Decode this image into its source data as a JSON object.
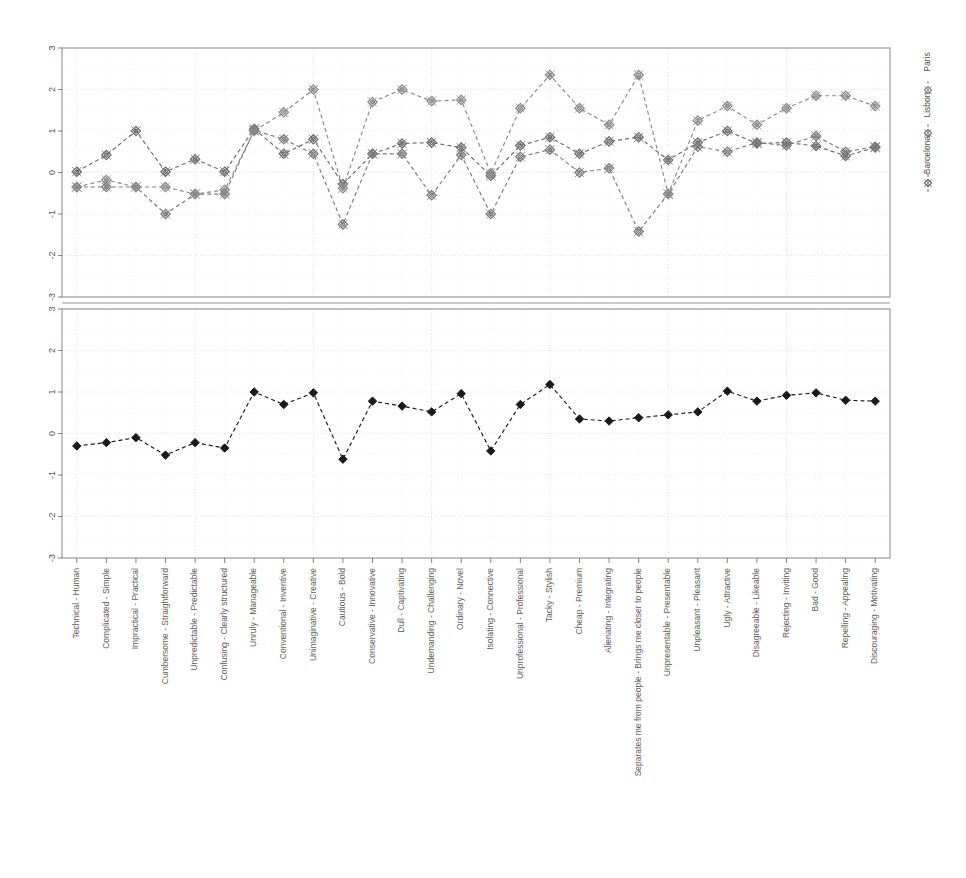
{
  "chart_data": {
    "type": "line",
    "title": "",
    "xlabel": "",
    "ylabel": "",
    "ylim": [
      -3,
      3
    ],
    "yticks": [
      3,
      2,
      1,
      0,
      -1,
      -2,
      -3
    ],
    "grid": true,
    "legend": {
      "position": "right",
      "orientation": "vertical-rotated",
      "entries": [
        "Barcelona",
        "Lisbon",
        "Paris"
      ]
    },
    "panels": [
      {
        "name": "top-panel",
        "series_names": [
          "Barcelona",
          "Lisbon",
          "Paris"
        ]
      },
      {
        "name": "bottom-panel",
        "series_names": [
          "Overall"
        ]
      }
    ],
    "categories": [
      "Technical - Human",
      "Complicated - Simple",
      "Impractical - Practical",
      "Cumbersome - Straightforward",
      "Unpredictable - Predictable",
      "Confusing - Clearly structured",
      "Unruly - Manageable",
      "Conventional - Inventive",
      "Unimaginative - Creative",
      "Cautious - Bold",
      "Conservative - Innovative",
      "Dull - Captivating",
      "Undemanding - Challenging",
      "Ordinary - Novel",
      "Isolating - Connective",
      "Unprofessional - Professional",
      "Tacky - Stylish",
      "Cheap - Premium",
      "Alienating - Integrating",
      "Separates me from people - Brings me closer to people",
      "Unpresentable - Presentable",
      "Unpleasant - Pleasant",
      "Ugly - Attractive",
      "Disagreeable - Likeable",
      "Rejecting - Inviting",
      "Bad - Good",
      "Repelling - Appealing",
      "Discouraging - Motivating"
    ],
    "series": [
      {
        "name": "Barcelona",
        "panel": "top-panel",
        "color": "#6d6d6d",
        "marker": "diamond",
        "values": [
          0.02,
          0.42,
          1.0,
          0.02,
          0.32,
          0.02,
          1.05,
          0.45,
          0.8,
          -0.28,
          0.45,
          0.7,
          0.72,
          0.6,
          -0.08,
          0.65,
          0.85,
          0.45,
          0.75,
          0.85,
          0.3,
          0.72,
          1.0,
          0.7,
          0.72,
          0.64,
          0.4,
          0.6
        ]
      },
      {
        "name": "Lisbon",
        "panel": "top-panel",
        "color": "#7a7a7a",
        "marker": "diamond",
        "values": [
          -0.35,
          -0.35,
          -0.35,
          -1.0,
          -0.52,
          -0.52,
          1.02,
          0.8,
          0.45,
          -1.25,
          0.45,
          0.45,
          -0.55,
          0.42,
          -1.0,
          0.38,
          0.55,
          0.0,
          0.1,
          -1.42,
          -0.52,
          0.62,
          0.5,
          0.72,
          0.65,
          0.88,
          0.5,
          0.62
        ]
      },
      {
        "name": "Paris",
        "panel": "top-panel",
        "color": "#8a8a8a",
        "marker": "diamond",
        "values": [
          -0.35,
          -0.18,
          -0.35,
          -0.35,
          -0.52,
          -0.42,
          1.0,
          1.45,
          2.0,
          -0.38,
          1.7,
          2.0,
          1.72,
          1.75,
          -0.02,
          1.55,
          2.35,
          1.55,
          1.15,
          2.35,
          -0.52,
          1.25,
          1.6,
          1.15,
          1.55,
          1.85,
          1.85,
          1.6
        ]
      },
      {
        "name": "Overall",
        "panel": "bottom-panel",
        "color": "#1a1a1a",
        "marker": "diamond-filled",
        "values": [
          -0.3,
          -0.22,
          -0.1,
          -0.52,
          -0.22,
          -0.35,
          1.0,
          0.7,
          0.98,
          -0.62,
          0.78,
          0.66,
          0.52,
          0.96,
          -0.42,
          0.7,
          1.18,
          0.35,
          0.3,
          0.38,
          0.45,
          0.52,
          1.02,
          0.78,
          0.92,
          0.98,
          0.8,
          0.78
        ]
      }
    ]
  },
  "axes": {
    "y_tick_labels": [
      "3",
      "2",
      "1",
      "0",
      "-1",
      "-2",
      "-3"
    ]
  }
}
